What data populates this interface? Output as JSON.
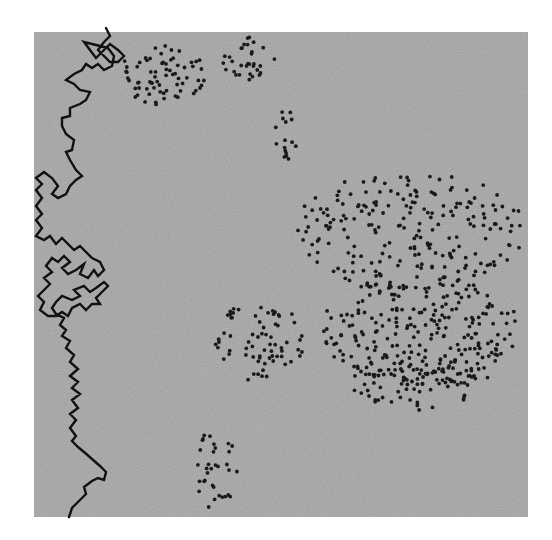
{
  "figure": {
    "background": "#ffffff",
    "panel": {
      "x": 34,
      "y": 32,
      "width": 494,
      "height": 485,
      "fill": "#b4b4b4",
      "noise": true
    },
    "line": {
      "color": "#111111",
      "stroke_width": 2.4,
      "points": [
        [
          69,
          517
        ],
        [
          72,
          508
        ],
        [
          80,
          500
        ],
        [
          86,
          494
        ],
        [
          84,
          487
        ],
        [
          92,
          481
        ],
        [
          98,
          478
        ],
        [
          104,
          480
        ],
        [
          106,
          472
        ],
        [
          100,
          466
        ],
        [
          92,
          459
        ],
        [
          84,
          452
        ],
        [
          78,
          447
        ],
        [
          72,
          441
        ],
        [
          76,
          436
        ],
        [
          70,
          428
        ],
        [
          76,
          420
        ],
        [
          70,
          414
        ],
        [
          78,
          408
        ],
        [
          72,
          400
        ],
        [
          80,
          394
        ],
        [
          72,
          388
        ],
        [
          78,
          382
        ],
        [
          70,
          376
        ],
        [
          78,
          369
        ],
        [
          70,
          362
        ],
        [
          74,
          355
        ],
        [
          66,
          348
        ],
        [
          70,
          341
        ],
        [
          62,
          336
        ],
        [
          66,
          330
        ],
        [
          60,
          325
        ],
        [
          64,
          318
        ],
        [
          56,
          314
        ],
        [
          52,
          308
        ],
        [
          56,
          302
        ],
        [
          62,
          296
        ],
        [
          72,
          300
        ],
        [
          80,
          296
        ],
        [
          74,
          290
        ],
        [
          84,
          286
        ],
        [
          90,
          292
        ],
        [
          96,
          288
        ],
        [
          104,
          282
        ],
        [
          108,
          286
        ],
        [
          102,
          292
        ],
        [
          96,
          298
        ],
        [
          100,
          304
        ],
        [
          92,
          304
        ],
        [
          86,
          310
        ],
        [
          80,
          304
        ],
        [
          72,
          308
        ],
        [
          68,
          316
        ],
        [
          62,
          312
        ],
        [
          56,
          316
        ],
        [
          48,
          316
        ],
        [
          40,
          310
        ],
        [
          44,
          302
        ],
        [
          38,
          296
        ],
        [
          44,
          290
        ],
        [
          50,
          284
        ],
        [
          44,
          278
        ],
        [
          52,
          272
        ],
        [
          46,
          266
        ],
        [
          52,
          258
        ],
        [
          58,
          262
        ],
        [
          64,
          256
        ],
        [
          70,
          262
        ],
        [
          62,
          268
        ],
        [
          68,
          274
        ],
        [
          76,
          270
        ],
        [
          84,
          264
        ],
        [
          80,
          274
        ],
        [
          88,
          278
        ],
        [
          94,
          270
        ],
        [
          98,
          276
        ],
        [
          104,
          270
        ],
        [
          100,
          262
        ],
        [
          92,
          258
        ],
        [
          86,
          252
        ],
        [
          80,
          246
        ],
        [
          74,
          250
        ],
        [
          68,
          244
        ],
        [
          62,
          238
        ],
        [
          56,
          244
        ],
        [
          50,
          236
        ],
        [
          44,
          240
        ],
        [
          36,
          236
        ],
        [
          42,
          228
        ],
        [
          36,
          220
        ],
        [
          42,
          214
        ],
        [
          36,
          206
        ],
        [
          42,
          198
        ],
        [
          36,
          190
        ],
        [
          42,
          184
        ],
        [
          36,
          178
        ],
        [
          44,
          172
        ],
        [
          52,
          178
        ],
        [
          58,
          186
        ],
        [
          52,
          194
        ],
        [
          58,
          198
        ],
        [
          66,
          194
        ],
        [
          70,
          186
        ],
        [
          76,
          180
        ],
        [
          82,
          176
        ],
        [
          76,
          170
        ],
        [
          70,
          160
        ],
        [
          66,
          152
        ],
        [
          72,
          150
        ],
        [
          74,
          140
        ],
        [
          66,
          134
        ],
        [
          62,
          126
        ],
        [
          62,
          118
        ],
        [
          70,
          116
        ],
        [
          70,
          108
        ],
        [
          80,
          104
        ],
        [
          86,
          100
        ],
        [
          90,
          92
        ],
        [
          80,
          90
        ],
        [
          74,
          84
        ],
        [
          66,
          80
        ],
        [
          74,
          74
        ],
        [
          82,
          70
        ],
        [
          86,
          64
        ],
        [
          92,
          68
        ],
        [
          98,
          64
        ],
        [
          104,
          70
        ],
        [
          112,
          66
        ],
        [
          114,
          56
        ],
        [
          108,
          48
        ],
        [
          100,
          46
        ],
        [
          92,
          44
        ],
        [
          84,
          42
        ],
        [
          90,
          50
        ],
        [
          96,
          58
        ],
        [
          102,
          52
        ],
        [
          110,
          44
        ],
        [
          118,
          50
        ],
        [
          124,
          56
        ],
        [
          118,
          62
        ],
        [
          110,
          62
        ],
        [
          104,
          56
        ],
        [
          98,
          50
        ],
        [
          104,
          42
        ],
        [
          110,
          36
        ],
        [
          106,
          28
        ]
      ]
    },
    "dots": {
      "color": "#1a1a1a",
      "radius": 1.9,
      "clusters": [
        {
          "cx": 165,
          "cy": 75,
          "rx": 48,
          "ry": 30,
          "count": 70,
          "seed": 11
        },
        {
          "cx": 248,
          "cy": 58,
          "rx": 30,
          "ry": 24,
          "count": 32,
          "seed": 17
        },
        {
          "cx": 285,
          "cy": 135,
          "rx": 14,
          "ry": 26,
          "count": 16,
          "seed": 23
        },
        {
          "cx": 410,
          "cy": 230,
          "rx": 115,
          "ry": 60,
          "count": 210,
          "seed": 31
        },
        {
          "cx": 420,
          "cy": 330,
          "rx": 100,
          "ry": 55,
          "count": 250,
          "seed": 37
        },
        {
          "cx": 420,
          "cy": 380,
          "rx": 70,
          "ry": 30,
          "count": 70,
          "seed": 41
        },
        {
          "cx": 260,
          "cy": 340,
          "rx": 45,
          "ry": 42,
          "count": 70,
          "seed": 43
        },
        {
          "cx": 215,
          "cy": 470,
          "rx": 22,
          "ry": 40,
          "count": 34,
          "seed": 47
        }
      ]
    }
  }
}
